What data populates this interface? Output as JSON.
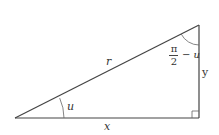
{
  "diagram": {
    "type": "right-triangle",
    "labels": {
      "hypotenuse": "r",
      "base": "x",
      "height": "y",
      "angle_bottom_left": "u",
      "angle_top_right_numerator": "π",
      "angle_top_right_denominator": "2",
      "angle_top_right_minus": "−",
      "angle_top_right_variable": "u"
    },
    "colors": {
      "line": "#444444",
      "text": "#333333",
      "background": "#ffffff"
    }
  }
}
